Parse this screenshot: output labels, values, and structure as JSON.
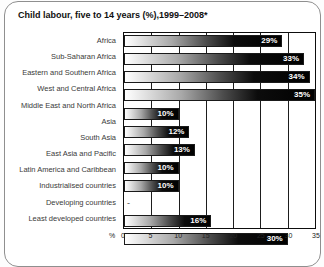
{
  "title": "Child labour, five to 14 years (%),1999–2008*",
  "colors": {
    "bar_gradient_start": "#ffffff",
    "bar_gradient_end": "#000000",
    "plot_frame": "#0d0d0d",
    "card_border": "#8f8f8f",
    "value_label_text": "#ffffff"
  },
  "chart_data": {
    "type": "bar",
    "orientation": "horizontal",
    "title": "Child labour, five to 14 years (%),1999–2008*",
    "categories": [
      "Africa",
      "Sub-Saharan Africa",
      "Eastern and Southern Africa",
      "West and Central Africa",
      "Middle East and North Africa",
      "Asia",
      "South Asia",
      "East Asia and Pacific",
      "Latin America and Caribbean",
      "Industrialised countries",
      "Developing countries",
      "Least developed countries"
    ],
    "values": [
      29,
      33,
      34,
      35,
      10,
      12,
      13,
      10,
      10,
      null,
      16,
      30
    ],
    "value_labels": [
      "29%",
      "33%",
      "34%",
      "35%",
      "10%",
      "12%",
      "13%",
      "10%",
      "10%",
      "-",
      "16%",
      "30%"
    ],
    "xlabel": "%",
    "xticks": [
      0,
      5,
      10,
      15,
      20,
      25,
      30,
      35
    ],
    "xlim": [
      0,
      35
    ],
    "grid": "vertical",
    "legend": "none",
    "bar_style": "horizontal gradient white to black"
  }
}
